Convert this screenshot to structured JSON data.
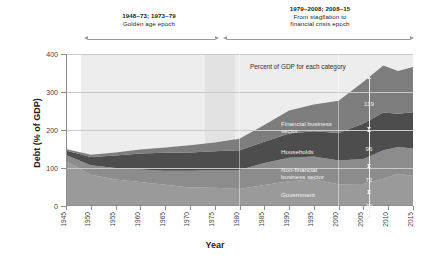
{
  "chart_data": {
    "type": "area",
    "stacked": true,
    "title": "",
    "xlabel": "Year",
    "ylabel": "Debt (% of GDP)",
    "xlim": [
      1945,
      2015
    ],
    "ylim": [
      0,
      400
    ],
    "yticks": [
      0,
      100,
      200,
      300,
      400
    ],
    "xticks": [
      1945,
      1950,
      1955,
      1960,
      1965,
      1970,
      1975,
      1980,
      1985,
      1990,
      1995,
      2000,
      2005,
      2010,
      2015
    ],
    "grid": true,
    "legend": "in-plot category labels",
    "in_plot_note": "Percent of GDP for each category",
    "x": [
      1945,
      1950,
      1955,
      1960,
      1965,
      1970,
      1975,
      1980,
      1985,
      1990,
      1995,
      2000,
      2005,
      2009,
      2012,
      2015
    ],
    "series": [
      {
        "name": "Government",
        "color": "#9a9a9a",
        "end_value": 79,
        "values": [
          118,
          82,
          70,
          63,
          56,
          49,
          48,
          45,
          55,
          65,
          70,
          57,
          58,
          72,
          85,
          79
        ]
      },
      {
        "name": "Non-financial business sector",
        "color": "#8c8c8c",
        "end_value": 72,
        "values": [
          16,
          25,
          30,
          33,
          37,
          44,
          47,
          50,
          58,
          62,
          60,
          63,
          66,
          75,
          70,
          72
        ]
      },
      {
        "name": "Households",
        "color": "#4d4d4d",
        "end_value": 96,
        "values": [
          12,
          22,
          33,
          42,
          47,
          48,
          49,
          52,
          56,
          64,
          67,
          72,
          93,
          99,
          88,
          96
        ]
      },
      {
        "name": "Financial business sector",
        "color": "#7d7d7d",
        "end_value": 119,
        "values": [
          4,
          6,
          8,
          11,
          14,
          19,
          23,
          30,
          44,
          60,
          70,
          85,
          110,
          124,
          112,
          119
        ]
      }
    ],
    "annotations": [
      {
        "id": "golden-age",
        "title": "1948–73; 1973–79",
        "subtitle": "Golden age epoch",
        "x_start": 1948,
        "x_end": 1979
      },
      {
        "id": "stagflation-crisis",
        "title": "1979–2008; 2008–15",
        "subtitle": "From stagflation to",
        "subtitle2": "financial crisis epoch",
        "x_start": 1979,
        "x_end": 2015
      }
    ],
    "shaded_bands": [
      {
        "x_start": 1948,
        "x_end": 1973,
        "color": "#ededed"
      },
      {
        "x_start": 1973,
        "x_end": 1979,
        "color": "#e2e2e2"
      },
      {
        "x_start": 1979,
        "x_end": 2015,
        "color": "#ededed"
      }
    ]
  },
  "axis": {
    "y_title": "Debt (% of GDP)",
    "x_title": "Year",
    "y_ticks": [
      "0",
      "100",
      "200",
      "300",
      "400"
    ],
    "x_ticks": [
      "1945",
      "1950",
      "1955",
      "1960",
      "1965",
      "1970",
      "1975",
      "1980",
      "1985",
      "1990",
      "1995",
      "2000",
      "2005",
      "2010",
      "2015"
    ]
  },
  "annotations": {
    "left": {
      "line1": "1948–73; 1973–79",
      "line2": "Golden age epoch"
    },
    "right": {
      "line1": "1979–2008; 2008–15",
      "line2": "From stagflation to",
      "line3": "financial crisis epoch"
    },
    "note": "Percent of GDP for each category"
  },
  "categories": {
    "financial": {
      "label_line1": "Financial business",
      "label_line2": "sector",
      "value": "119"
    },
    "households": {
      "label_line1": "Households",
      "value": "96"
    },
    "nonfinancial": {
      "label_line1": "Non-financial",
      "label_line2": "business sector",
      "value": "72"
    },
    "government": {
      "label_line1": "Government",
      "value": "79"
    }
  }
}
